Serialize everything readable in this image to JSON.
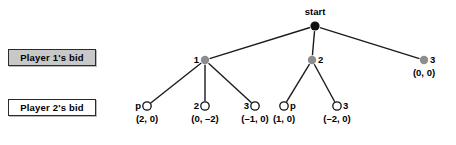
{
  "figure": {
    "type": "game-tree",
    "root": {
      "id": "start",
      "label": "start",
      "x": 315,
      "y": 26,
      "fill": "#111111",
      "radius": 4.6
    },
    "row_labels": [
      {
        "id": "player1-bid",
        "text": "Player 1's bid",
        "fill": "#c8c8c8"
      },
      {
        "id": "player2-bid",
        "text": "Player 2's bid",
        "fill": "#ffffff"
      }
    ],
    "level1": {
      "fill": "#8d8d8d",
      "radius": 4.2,
      "nodes": [
        {
          "id": "p1-bid-1",
          "label": "1",
          "label_side": "left",
          "x": 205,
          "y": 60,
          "payoff": ""
        },
        {
          "id": "p1-bid-2",
          "label": "2",
          "label_side": "right",
          "x": 312,
          "y": 60,
          "payoff": ""
        },
        {
          "id": "p1-bid-3",
          "label": "3",
          "label_side": "right",
          "x": 424,
          "y": 60,
          "payoff": "(0, 0)"
        }
      ]
    },
    "level2": {
      "fill": "#ffffff",
      "stroke": "#111111",
      "radius": 4.2,
      "nodes": [
        {
          "id": "p2-pass-a",
          "label": "p",
          "label_side": "left",
          "x": 147,
          "y": 106,
          "payoff": "(2, 0)",
          "parent": "p1-bid-1"
        },
        {
          "id": "p2-bid-2a",
          "label": "2",
          "label_side": "left",
          "x": 205,
          "y": 106,
          "payoff": "(0, –2)",
          "parent": "p1-bid-1"
        },
        {
          "id": "p2-bid-3a",
          "label": "3",
          "label_side": "left",
          "x": 255,
          "y": 106,
          "payoff": "(–1, 0)",
          "parent": "p1-bid-1"
        },
        {
          "id": "p2-pass-b",
          "label": "p",
          "label_side": "right",
          "x": 284,
          "y": 106,
          "payoff": "(1, 0)",
          "parent": "p1-bid-2"
        },
        {
          "id": "p2-bid-3b",
          "label": "3",
          "label_side": "right",
          "x": 337,
          "y": 106,
          "payoff": "(–2, 0)",
          "parent": "p1-bid-2"
        }
      ]
    },
    "edges": [
      {
        "from": "start",
        "to": "p1-bid-1"
      },
      {
        "from": "start",
        "to": "p1-bid-2"
      },
      {
        "from": "start",
        "to": "p1-bid-3"
      },
      {
        "from": "p1-bid-1",
        "to": "p2-pass-a"
      },
      {
        "from": "p1-bid-1",
        "to": "p2-bid-2a"
      },
      {
        "from": "p1-bid-1",
        "to": "p2-bid-3a"
      },
      {
        "from": "p1-bid-2",
        "to": "p2-pass-b"
      },
      {
        "from": "p1-bid-2",
        "to": "p2-bid-3b"
      }
    ],
    "edge_color": "#1b1b1b",
    "edge_width": 1.4
  }
}
